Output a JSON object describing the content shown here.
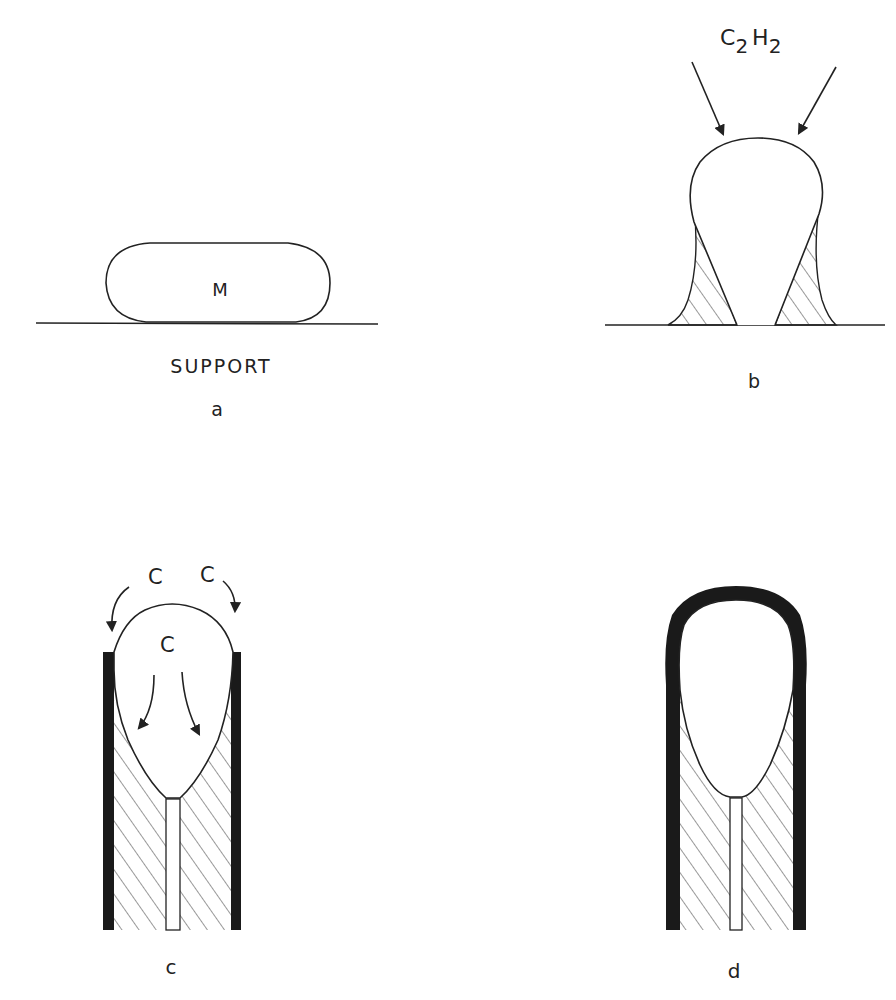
{
  "panels": {
    "a": {
      "label": "a",
      "particle_label": "M",
      "support_label": "SUPPORT"
    },
    "b": {
      "label": "b",
      "gas_main": "C",
      "gas_sub1": "2",
      "gas_mid": "H",
      "gas_sub2": "2"
    },
    "c": {
      "label": "c",
      "carbon_left": "C",
      "carbon_right": "C",
      "carbon_inner": "C"
    },
    "d": {
      "label": "d"
    }
  },
  "colors": {
    "ink": "#222222",
    "background": "#ffffff"
  }
}
